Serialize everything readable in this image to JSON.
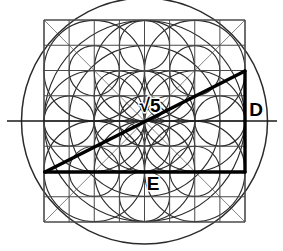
{
  "figure": {
    "canvas": {
      "width": 283,
      "height": 251,
      "background": "#ffffff"
    },
    "colors": {
      "ink": "#1a1a1a",
      "grid": "#4a4a4a",
      "circle": "#2b2b2b",
      "thick": "#000000",
      "background": "#ffffff"
    },
    "grid": {
      "label": "8 by 8 square grid",
      "x0": 44,
      "y0": 20,
      "x1": 245,
      "y1": 222,
      "columns": 8,
      "rows": 8,
      "cell": 25.125
    },
    "outer_circle": {
      "label": "circumscribing circle",
      "cx": 144.5,
      "cy": 121,
      "r": 123
    },
    "axis_line": {
      "label": "horizontal diameter",
      "x1": 7,
      "y1": 121,
      "x2": 277,
      "y2": 121
    },
    "triangle": {
      "label": "right triangle with hypotenuse root five",
      "ax": 45,
      "ay": 172,
      "bx": 245,
      "by": 71,
      "cx": 245,
      "cy": 172
    },
    "labels": [
      {
        "name": "hypotenuse-label",
        "text": "√5",
        "x": 150,
        "y": 112,
        "size": 19,
        "anchor": "middle"
      },
      {
        "name": "side-d-label",
        "text": "D",
        "x": 256,
        "y": 116,
        "size": 19,
        "anchor": "middle"
      },
      {
        "name": "side-e-label",
        "text": "E",
        "x": 153,
        "y": 190,
        "size": 19,
        "anchor": "middle"
      }
    ],
    "construction_circles": [
      {
        "cx": 144.5,
        "cy": 121,
        "r": 123
      },
      {
        "cx": 144.5,
        "cy": 121,
        "r": 100.5
      },
      {
        "cx": 144.5,
        "cy": 121,
        "r": 75.4
      },
      {
        "cx": 144.5,
        "cy": 121,
        "r": 50.25
      },
      {
        "cx": 144.5,
        "cy": 121,
        "r": 25.1
      },
      {
        "cx": 94.2,
        "cy": 70.7,
        "r": 50.25
      },
      {
        "cx": 194.8,
        "cy": 70.7,
        "r": 50.25
      },
      {
        "cx": 94.2,
        "cy": 171.3,
        "r": 50.25
      },
      {
        "cx": 194.8,
        "cy": 171.3,
        "r": 50.25
      },
      {
        "cx": 144.5,
        "cy": 70.7,
        "r": 50.25
      },
      {
        "cx": 144.5,
        "cy": 171.3,
        "r": 50.25
      },
      {
        "cx": 94.2,
        "cy": 121,
        "r": 50.25
      },
      {
        "cx": 194.8,
        "cy": 121,
        "r": 50.25
      },
      {
        "cx": 144.5,
        "cy": 45.6,
        "r": 25.1
      },
      {
        "cx": 144.5,
        "cy": 196.4,
        "r": 25.1
      },
      {
        "cx": 119.3,
        "cy": 95.9,
        "r": 25.1
      },
      {
        "cx": 169.7,
        "cy": 95.9,
        "r": 25.1
      },
      {
        "cx": 119.3,
        "cy": 146.1,
        "r": 25.1
      },
      {
        "cx": 169.7,
        "cy": 146.1,
        "r": 25.1
      },
      {
        "cx": 119.3,
        "cy": 121,
        "r": 25.1
      },
      {
        "cx": 169.7,
        "cy": 121,
        "r": 25.1
      },
      {
        "cx": 144.5,
        "cy": 95.9,
        "r": 25.1
      },
      {
        "cx": 144.5,
        "cy": 146.1,
        "r": 25.1
      },
      {
        "cx": 94.2,
        "cy": 70.7,
        "r": 25.1
      },
      {
        "cx": 194.8,
        "cy": 70.7,
        "r": 25.1
      },
      {
        "cx": 94.2,
        "cy": 171.3,
        "r": 25.1
      },
      {
        "cx": 194.8,
        "cy": 171.3,
        "r": 25.1
      },
      {
        "cx": 69.1,
        "cy": 121,
        "r": 25.1
      },
      {
        "cx": 219.9,
        "cy": 121,
        "r": 25.1
      }
    ],
    "diagonal_guides": [
      {
        "x1": 44,
        "y1": 222,
        "x2": 245,
        "y2": 20
      },
      {
        "x1": 44,
        "y1": 20,
        "x2": 245,
        "y2": 222
      }
    ]
  }
}
